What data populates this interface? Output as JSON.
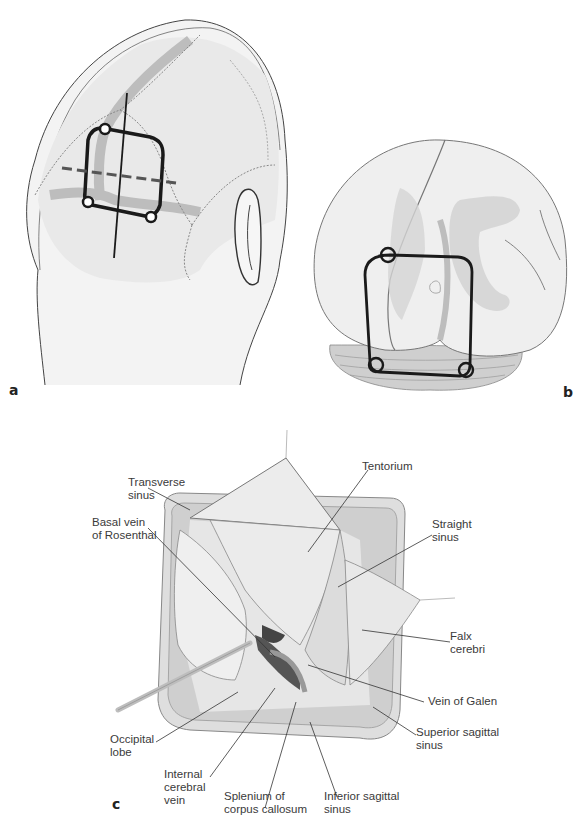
{
  "figure": {
    "panels": [
      {
        "id": "a",
        "label": "a",
        "description": "Posterior-lateral view of head with craniotomy outline over transverse sinus / occipital region"
      },
      {
        "id": "b",
        "label": "b",
        "description": "Posterior view of brain with craniotomy outline over occipital lobes"
      },
      {
        "id": "c",
        "label": "c",
        "description": "Occipital interhemispheric approach surgical exposure"
      }
    ],
    "panel_c_labels": {
      "transverse_sinus": "Transverse\nsinus",
      "tentorium": "Tentorium",
      "straight_sinus": "Straight\nsinus",
      "basal_vein": "Basal vein\nof Rosenthal",
      "falx_cerebri": "Falx\ncerebri",
      "vein_of_galen": "Vein of Galen",
      "occipital_lobe": "Occipital\nlobe",
      "superior_sagittal_sinus": "Superior sagittal\nsinus",
      "internal_cerebral_vein": "Internal\ncerebral\nvein",
      "splenium": "Splenium of\ncorpus callosum",
      "inferior_sagittal_sinus": "Inferior sagittal\nsinus"
    },
    "colors": {
      "outline": "#1a1a1a",
      "sinus_band": "#b5b5b5",
      "skin": "#f2f2f2",
      "line": "#555555"
    }
  }
}
